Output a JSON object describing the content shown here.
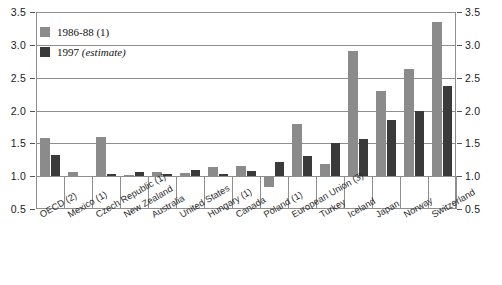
{
  "chart_data": {
    "type": "bar",
    "title": "",
    "xlabel": "",
    "ylabel": "",
    "ylim": [
      0.5,
      3.5
    ],
    "ytick_values": [
      0.5,
      1.0,
      1.5,
      2.0,
      2.5,
      3.0,
      3.5
    ],
    "ytick_labels": [
      "0.5",
      "1.0",
      "1.5",
      "2.0",
      "2.5",
      "3.0",
      "3.5"
    ],
    "ytick_labels_right": [
      "0.5",
      "1.0",
      "1.5",
      "2.0",
      "2.5",
      "3.0",
      "3.5"
    ],
    "grid": true,
    "legend_position": "upper-left",
    "baseline": 1.0,
    "categories": [
      "OECD (2)",
      "Mexico (1)",
      "Czech Republic (1)",
      "New Zealand",
      "Australia",
      "United States",
      "Hungary (1)",
      "Canada",
      "Poland (1)",
      "European Union (3)",
      "Turkey",
      "Iceland",
      "Japan",
      "Norway",
      "Switzerland"
    ],
    "series": [
      {
        "name": "1986-88 (1)",
        "color": "#8b8b8b",
        "values": [
          1.58,
          1.06,
          1.6,
          1.02,
          1.07,
          1.05,
          1.14,
          1.15,
          0.83,
          1.8,
          1.19,
          2.9,
          2.3,
          2.63,
          3.35
        ]
      },
      {
        "name": "1997 (estimate)",
        "color": "#3a3a3a",
        "values": [
          1.32,
          null,
          1.03,
          1.07,
          1.04,
          1.09,
          1.04,
          1.08,
          1.22,
          1.3,
          1.5,
          1.57,
          1.85,
          2.0,
          2.38
        ]
      }
    ]
  },
  "legend": {
    "items": [
      {
        "label": "1986-88 (1)",
        "emphasis": "",
        "swatch": "light"
      },
      {
        "label": "1997 ",
        "emphasis": "(estimate)",
        "swatch": "dark"
      }
    ]
  }
}
